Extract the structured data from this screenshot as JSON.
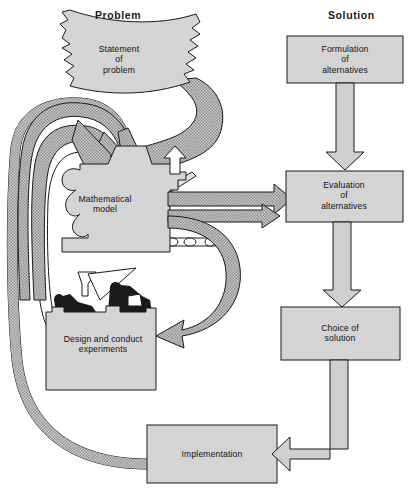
{
  "figure": {
    "width": 413,
    "height": 496
  },
  "headers": {
    "problem": "Problem",
    "solution": "Solution"
  },
  "colors": {
    "box_fill": "#d4d4d4",
    "box_stroke": "#1a1a1a",
    "pipe_fill": "#b9b9b9",
    "pipe_stroke": "#1a1a1a",
    "arrow_light_fill": "#cfcfcf",
    "paper_fill": "#d4d4d4",
    "text": "#111111",
    "background": "#ffffff"
  },
  "nodes": [
    {
      "id": "statement-of-problem",
      "label": "Statement\nof\nproblem",
      "shape": "torn-paper",
      "column": "problem",
      "cx": 119,
      "cy": 60
    },
    {
      "id": "mathematical-model",
      "label": "Mathematical\nmodel",
      "shape": "machine",
      "column": "problem",
      "cx": 105,
      "cy": 204
    },
    {
      "id": "design-and-conduct-experiments",
      "label": "Design and conduct\nexperiments",
      "shape": "bench-with-figures",
      "column": "problem",
      "cx": 103,
      "cy": 344
    },
    {
      "id": "formulation-of-alternatives",
      "label": "Formulation\nof\nalternatives",
      "shape": "rectangle",
      "column": "solution",
      "cx": 345,
      "cy": 60
    },
    {
      "id": "evaluation-of-alternatives",
      "label": "Evaluation\nof\nalternatives",
      "shape": "rectangle",
      "column": "solution",
      "cx": 344,
      "cy": 196
    },
    {
      "id": "choice-of-solution",
      "label": "Choice of\nsolution",
      "shape": "rectangle",
      "column": "solution",
      "cx": 340,
      "cy": 333
    },
    {
      "id": "implementation",
      "label": "Implementation",
      "shape": "rectangle",
      "column": "solution",
      "cx": 212,
      "cy": 454
    }
  ],
  "connectors": [
    {
      "id": "statement-to-model",
      "from": "statement-of-problem",
      "to": "mathematical-model",
      "style": "shaded-pipe-arrow"
    },
    {
      "id": "model-smokestack",
      "from": "mathematical-model",
      "to": "",
      "style": "small-up-arrow"
    },
    {
      "id": "model-to-evaluation-upper",
      "from": "mathematical-model",
      "to": "evaluation-of-alternatives",
      "style": "shaded-pipe-arrow"
    },
    {
      "id": "model-to-evaluation-lower",
      "from": "mathematical-model",
      "to": "evaluation-of-alternatives",
      "style": "shaded-pipe-arrow"
    },
    {
      "id": "model-to-experiments",
      "from": "mathematical-model",
      "to": "design-and-conduct-experiments",
      "style": "shaded-pipe-arrow"
    },
    {
      "id": "experiments-to-model",
      "from": "design-and-conduct-experiments",
      "to": "mathematical-model",
      "style": "shaded-pipe-arrow"
    },
    {
      "id": "implementation-to-model",
      "from": "implementation",
      "to": "mathematical-model",
      "style": "shaded-pipe-arrow"
    },
    {
      "id": "formulation-to-evaluation",
      "from": "formulation-of-alternatives",
      "to": "evaluation-of-alternatives",
      "style": "block-arrow-down"
    },
    {
      "id": "evaluation-to-choice",
      "from": "evaluation-of-alternatives",
      "to": "choice-of-solution",
      "style": "block-arrow-down"
    },
    {
      "id": "choice-to-implementation",
      "from": "choice-of-solution",
      "to": "implementation",
      "style": "block-arrow-elbow-left"
    }
  ]
}
